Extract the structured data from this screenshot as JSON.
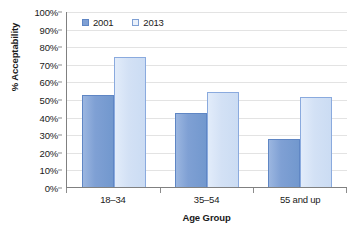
{
  "chart_data": {
    "type": "bar",
    "title": "",
    "subtitle": "",
    "categories": [
      "18–34",
      "35–54",
      "55 and up"
    ],
    "series": [
      {
        "name": "2001",
        "values": [
          52,
          42,
          27
        ],
        "color": "#7fa0d4"
      },
      {
        "name": "2013",
        "values": [
          74,
          54,
          51
        ],
        "color": "#d3e1f5"
      }
    ],
    "xlabel": "Age Group",
    "ylabel": "% Acceptability",
    "ylim": [
      0,
      100
    ],
    "ytick_step": 10,
    "ytick_labels": [
      "0%",
      "10%",
      "20%",
      "30%",
      "40%",
      "50%",
      "60%",
      "70%",
      "80%",
      "90%",
      "100%"
    ],
    "ytick_values": [
      0,
      10,
      20,
      30,
      40,
      50,
      60,
      70,
      80,
      90,
      100
    ],
    "grid": true,
    "grid_axis": "y",
    "grid_color": "#e3e3e3",
    "legend": true,
    "legend_position": "top-left-inside",
    "background_color": "#ffffff",
    "axis_color": "#808080",
    "value_suffix": "%"
  },
  "legend": {
    "entries": [
      {
        "label": "2001"
      },
      {
        "label": "2013"
      }
    ]
  },
  "axes": {
    "x_title": "Age Group",
    "y_title": "% Acceptability"
  }
}
